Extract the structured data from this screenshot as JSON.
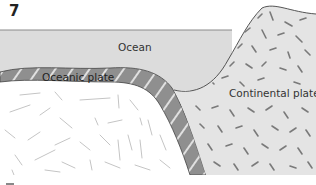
{
  "figure": {
    "number": "7",
    "type": "subduction cross-section diagram"
  },
  "labels": {
    "ocean": "Ocean",
    "oceanic_plate": "Oceanic plate",
    "continental_plate": "Continental plate"
  },
  "colors": {
    "ocean": "#dcdcdc",
    "ocean_surface_line": "#8a8a8a",
    "oceanic_plate": "#8f8f8f",
    "oceanic_plate_stripes": "#e0e0e0",
    "continental_plate": "#e4e4e4",
    "continental_speckles": "#7a7a7a",
    "mantle": "#ffffff",
    "mantle_strokes": "#c4c4c4",
    "outline": "#444444"
  }
}
